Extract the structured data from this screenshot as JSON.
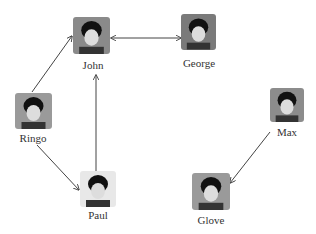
{
  "nodes": [
    {
      "id": "john",
      "label": "John",
      "img": {
        "x": 73,
        "y": 17,
        "w": 37,
        "h": 37
      },
      "label_pos": {
        "x": 93,
        "y": 59
      },
      "bg": "#8a8a8a"
    },
    {
      "id": "george",
      "label": "George",
      "img": {
        "x": 181,
        "y": 14,
        "w": 35,
        "h": 36
      },
      "label_pos": {
        "x": 199,
        "y": 57
      },
      "bg": "#7a7a7a"
    },
    {
      "id": "ringo",
      "label": "Ringo",
      "img": {
        "x": 15,
        "y": 93,
        "w": 37,
        "h": 36
      },
      "label_pos": {
        "x": 33,
        "y": 132
      },
      "bg": "#9a9a9a"
    },
    {
      "id": "paul",
      "label": "Paul",
      "img": {
        "x": 80,
        "y": 171,
        "w": 36,
        "h": 36
      },
      "label_pos": {
        "x": 98,
        "y": 209
      },
      "bg": "#e8e8e8"
    },
    {
      "id": "max",
      "label": "Max",
      "img": {
        "x": 270,
        "y": 88,
        "w": 34,
        "h": 34
      },
      "label_pos": {
        "x": 287,
        "y": 126
      },
      "bg": "#8c8c8c"
    },
    {
      "id": "glove",
      "label": "Glove",
      "img": {
        "x": 192,
        "y": 173,
        "w": 38,
        "h": 37
      },
      "label_pos": {
        "x": 211,
        "y": 214
      },
      "bg": "#9a9a9a"
    }
  ],
  "edges": [
    {
      "from": "john",
      "to": "george",
      "bidirectional": true,
      "x1": 111,
      "y1": 38,
      "x2": 181,
      "y2": 38
    },
    {
      "from": "ringo",
      "to": "john",
      "bidirectional": false,
      "x1": 32,
      "y1": 92,
      "x2": 72,
      "y2": 36
    },
    {
      "from": "ringo",
      "to": "paul",
      "bidirectional": false,
      "x1": 37,
      "y1": 145,
      "x2": 79,
      "y2": 190
    },
    {
      "from": "paul",
      "to": "john",
      "bidirectional": false,
      "x1": 96,
      "y1": 171,
      "x2": 96,
      "y2": 75
    },
    {
      "from": "max",
      "to": "glove",
      "bidirectional": false,
      "x1": 270,
      "y1": 132,
      "x2": 230,
      "y2": 183
    }
  ],
  "colors": {
    "edge": "#444444",
    "label": "#333333"
  }
}
